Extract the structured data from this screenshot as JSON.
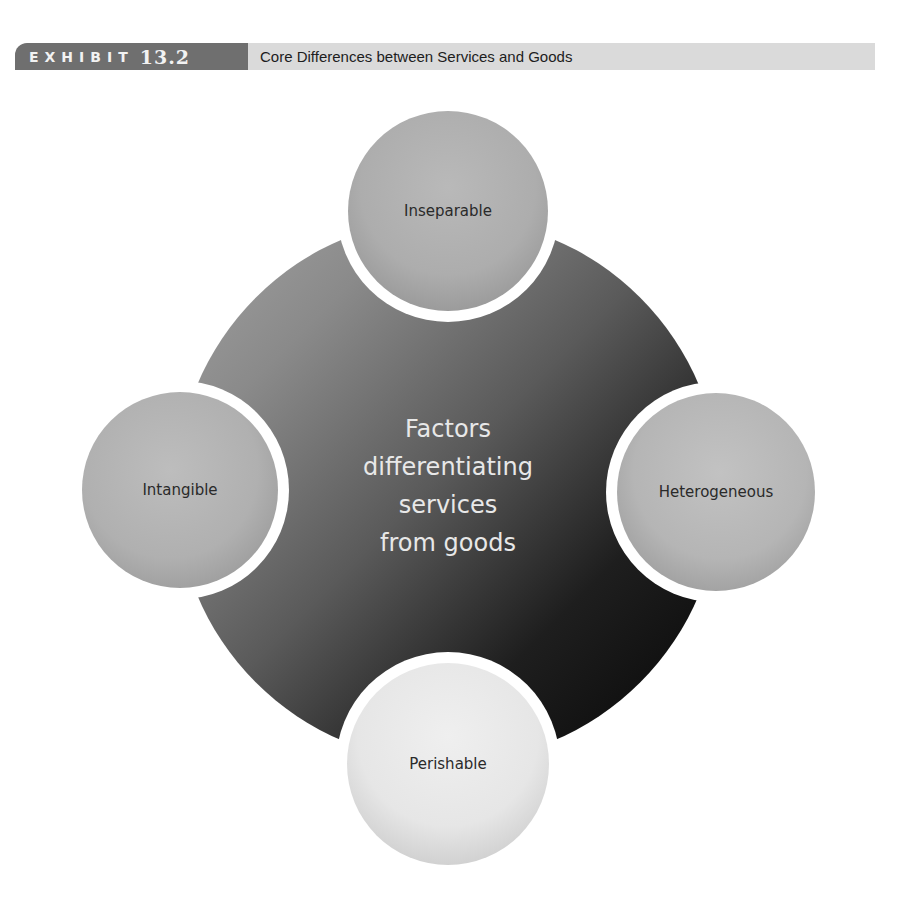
{
  "header": {
    "exhibit_word": "EXHIBIT",
    "exhibit_number": "13.2",
    "title": "Core Differences between Services and Goods",
    "label_bg_color": "#6f6f6f",
    "title_bar_color": "#dadada"
  },
  "diagram": {
    "center": {
      "lines": [
        "Factors",
        "differentiating",
        "services",
        "from goods"
      ]
    },
    "nodes": [
      {
        "position": "top",
        "label": "Inseparable"
      },
      {
        "position": "left",
        "label": "Intangible"
      },
      {
        "position": "right",
        "label": "Heterogeneous"
      },
      {
        "position": "bottom",
        "label": "Perishable"
      }
    ]
  }
}
